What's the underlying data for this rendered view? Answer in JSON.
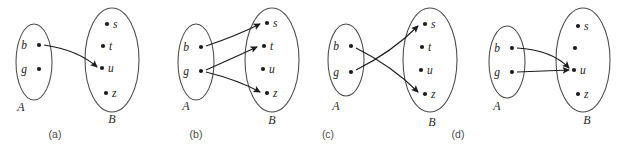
{
  "figure": {
    "background_color": "#ffffff",
    "line_color": "#1c1c1c",
    "ellipse_color": "#4a4a4a"
  },
  "panels": [
    {
      "id": "a",
      "caption": "(a)",
      "caption_x": 55,
      "caption_y": 138,
      "domain": {
        "label": "A",
        "label_x": 21,
        "label_y": 111,
        "ellipse": {
          "cx": 34,
          "cy": 62,
          "rx": 18,
          "ry": 38
        },
        "elements": [
          {
            "name": "b",
            "dot_x": 39,
            "dot_y": 45,
            "label_x": 27,
            "label_y": 49
          },
          {
            "name": "g",
            "dot_x": 39,
            "dot_y": 69,
            "label_x": 27,
            "label_y": 73
          }
        ]
      },
      "codomain": {
        "label": "B",
        "label_x": 112,
        "label_y": 123,
        "ellipse": {
          "cx": 112,
          "cy": 60,
          "rx": 27,
          "ry": 52
        },
        "elements": [
          {
            "name": "s",
            "dot_x": 107,
            "dot_y": 24,
            "label_x": 113,
            "label_y": 28
          },
          {
            "name": "t",
            "dot_x": 103,
            "dot_y": 46,
            "label_x": 109,
            "label_y": 50
          },
          {
            "name": "u",
            "dot_x": 102,
            "dot_y": 68,
            "label_x": 108,
            "label_y": 72
          },
          {
            "name": "z",
            "dot_x": 106,
            "dot_y": 93,
            "label_x": 112,
            "label_y": 97
          }
        ]
      },
      "arrows": [
        {
          "from": "b",
          "to": "u",
          "path": "M 44 45 Q 78 50 97 67"
        }
      ]
    },
    {
      "id": "b",
      "caption": "(b)",
      "caption_x": 196,
      "caption_y": 138,
      "domain": {
        "label": "A",
        "label_x": 186,
        "label_y": 110,
        "ellipse": {
          "cx": 196,
          "cy": 62,
          "rx": 18,
          "ry": 38
        },
        "elements": [
          {
            "name": "b",
            "dot_x": 201,
            "dot_y": 47,
            "label_x": 189,
            "label_y": 51
          },
          {
            "name": "g",
            "dot_x": 201,
            "dot_y": 71,
            "label_x": 189,
            "label_y": 75
          }
        ]
      },
      "codomain": {
        "label": "B",
        "label_x": 272,
        "label_y": 124,
        "ellipse": {
          "cx": 272,
          "cy": 60,
          "rx": 27,
          "ry": 52
        },
        "elements": [
          {
            "name": "s",
            "dot_x": 267,
            "dot_y": 23,
            "label_x": 273,
            "label_y": 27
          },
          {
            "name": "t",
            "dot_x": 264,
            "dot_y": 46,
            "label_x": 270,
            "label_y": 50
          },
          {
            "name": "u",
            "dot_x": 263,
            "dot_y": 69,
            "label_x": 269,
            "label_y": 73
          },
          {
            "name": "z",
            "dot_x": 267,
            "dot_y": 93,
            "label_x": 273,
            "label_y": 97
          }
        ]
      },
      "arrows": [
        {
          "from": "b",
          "to": "s",
          "path": "M 206 46 Q 236 36 260 24"
        },
        {
          "from": "g",
          "to": "t",
          "path": "M 206 70 Q 233 58 257 47"
        },
        {
          "from": "g",
          "to": "z",
          "path": "M 206 72 Q 238 80 260 92"
        }
      ]
    },
    {
      "id": "c",
      "caption": "(c)",
      "caption_x": 328,
      "caption_y": 138,
      "domain": {
        "label": "A",
        "label_x": 336,
        "label_y": 110,
        "ellipse": {
          "cx": 346,
          "cy": 60,
          "rx": 18,
          "ry": 36
        },
        "elements": [
          {
            "name": "b",
            "dot_x": 351,
            "dot_y": 46,
            "label_x": 339,
            "label_y": 50
          },
          {
            "name": "g",
            "dot_x": 351,
            "dot_y": 72,
            "label_x": 339,
            "label_y": 76
          }
        ]
      },
      "codomain": {
        "label": "B",
        "label_x": 432,
        "label_y": 126,
        "ellipse": {
          "cx": 430,
          "cy": 60,
          "rx": 27,
          "ry": 52
        },
        "elements": [
          {
            "name": "s",
            "dot_x": 425,
            "dot_y": 24,
            "label_x": 431,
            "label_y": 28
          },
          {
            "name": "t",
            "dot_x": 422,
            "dot_y": 47,
            "label_x": 428,
            "label_y": 51
          },
          {
            "name": "u",
            "dot_x": 421,
            "dot_y": 70,
            "label_x": 427,
            "label_y": 74
          },
          {
            "name": "z",
            "dot_x": 425,
            "dot_y": 94,
            "label_x": 431,
            "label_y": 98
          }
        ]
      },
      "arrows": [
        {
          "from": "b",
          "to": "z",
          "path": "M 356 48 Q 392 66 418 92"
        },
        {
          "from": "g",
          "to": "s",
          "path": "M 356 70 Q 392 52 418 26"
        }
      ]
    },
    {
      "id": "d",
      "caption": "(d)",
      "caption_x": 458,
      "caption_y": 138,
      "domain": {
        "label": "A",
        "label_x": 497,
        "label_y": 110,
        "ellipse": {
          "cx": 507,
          "cy": 62,
          "rx": 18,
          "ry": 36
        },
        "elements": [
          {
            "name": "b",
            "dot_x": 512,
            "dot_y": 48,
            "label_x": 500,
            "label_y": 52
          },
          {
            "name": "g",
            "dot_x": 512,
            "dot_y": 72,
            "label_x": 500,
            "label_y": 76
          }
        ]
      },
      "codomain": {
        "label": "B",
        "label_x": 587,
        "label_y": 124,
        "ellipse": {
          "cx": 583,
          "cy": 60,
          "rx": 27,
          "ry": 52
        },
        "elements": [
          {
            "name": "s",
            "dot_x": 578,
            "dot_y": 26,
            "label_x": 584,
            "label_y": 30
          },
          {
            "name": "",
            "dot_x": 575,
            "dot_y": 48,
            "label_x": 581,
            "label_y": 52
          },
          {
            "name": "u",
            "dot_x": 574,
            "dot_y": 70,
            "label_x": 580,
            "label_y": 74
          },
          {
            "name": "z",
            "dot_x": 578,
            "dot_y": 94,
            "label_x": 584,
            "label_y": 98
          }
        ]
      },
      "arrows": [
        {
          "from": "b",
          "to": "u",
          "path": "M 517 48 Q 552 50 569 68"
        },
        {
          "from": "g",
          "to": "u",
          "path": "M 517 72 Q 546 71 569 70"
        }
      ]
    }
  ]
}
